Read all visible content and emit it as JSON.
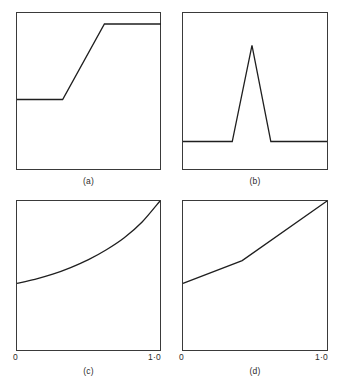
{
  "figure": {
    "background_color": "#ffffff",
    "line_color": "#1f1f1f",
    "frame_color": "#3a3a3a",
    "panel_count": 4,
    "layout": "2x2 grid"
  },
  "panels": [
    {
      "id": "a",
      "caption": "(a)",
      "description": "step-like ramp: low plateau, linear rise, high plateau"
    },
    {
      "id": "b",
      "caption": "(b)",
      "description": "flat baseline with a single narrow triangular peak"
    },
    {
      "id": "c",
      "caption": "(c)",
      "description": "smooth convex increasing curve"
    },
    {
      "id": "d",
      "caption": "(d)",
      "description": "two-segment piecewise linear increasing line with a kink"
    }
  ],
  "axis": {
    "tick_left_label": "0",
    "tick_right_label": "1·0",
    "range": [
      0,
      1
    ]
  },
  "chart_data": [
    {
      "type": "line",
      "title": "(a)",
      "xlabel": "",
      "ylabel": "",
      "xlim": [
        0,
        1
      ],
      "ylim": [
        0,
        1
      ],
      "grid": false,
      "legend": "none",
      "x": [
        0.0,
        0.317,
        0.607,
        1.0
      ],
      "y": [
        0.449,
        0.449,
        0.93,
        0.93
      ]
    },
    {
      "type": "line",
      "title": "(b)",
      "xlabel": "",
      "ylabel": "",
      "xlim": [
        0,
        1
      ],
      "ylim": [
        0,
        1
      ],
      "grid": false,
      "legend": "none",
      "x": [
        0.0,
        0.342,
        0.479,
        0.61,
        1.0
      ],
      "y": [
        0.095,
        0.095,
        0.772,
        0.095,
        0.095
      ]
    },
    {
      "type": "line",
      "title": "(c)",
      "xlabel": "",
      "ylabel": "",
      "xlim": [
        0,
        1
      ],
      "ylim": [
        0,
        1
      ],
      "grid": false,
      "legend": "none",
      "x": [
        0.0,
        0.125,
        0.25,
        0.375,
        0.5,
        0.625,
        0.75,
        0.875,
        1.0
      ],
      "y": [
        0.451,
        0.478,
        0.512,
        0.556,
        0.609,
        0.675,
        0.755,
        0.86,
        1.0
      ]
    },
    {
      "type": "line",
      "title": "(d)",
      "xlabel": "",
      "ylabel": "",
      "xlim": [
        0,
        1
      ],
      "ylim": [
        0,
        1
      ],
      "grid": false,
      "legend": "none",
      "x": [
        0.0,
        0.411,
        1.0
      ],
      "y": [
        0.451,
        0.603,
        1.0
      ]
    }
  ]
}
